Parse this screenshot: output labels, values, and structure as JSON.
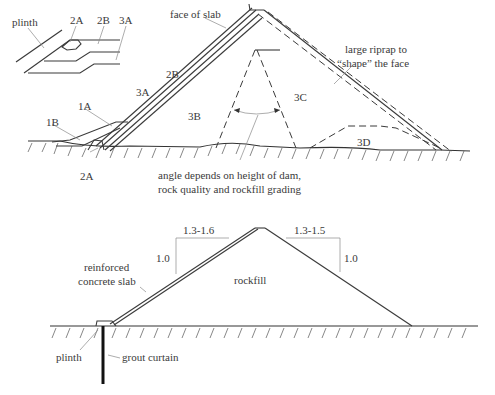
{
  "inset": {
    "labels": {
      "plinth": "plinth",
      "zone_2a": "2A",
      "zone_2b": "2B",
      "zone_3a": "3A"
    }
  },
  "upper_section": {
    "labels": {
      "face_of_slab": "face of slab",
      "riprap_line1": "large riprap to",
      "riprap_line2": "“shape” the face",
      "zone_2b": "2B",
      "zone_3a": "3A",
      "zone_1a": "1A",
      "zone_1b": "1B",
      "zone_3b": "3B",
      "zone_3c": "3C",
      "zone_3d": "3D",
      "zone_2a": "2A",
      "angle_note_line1": "angle depends on height of dam,",
      "angle_note_line2": "rock quality and rockfill grading"
    }
  },
  "lower_section": {
    "labels": {
      "upstream_slope_h": "1.3-1.6",
      "upstream_slope_v": "1.0",
      "downstream_slope_h": "1.3-1.5",
      "downstream_slope_v": "1.0",
      "slab_line1": "reinforced",
      "slab_line2": "concrete slab",
      "rockfill": "rockfill",
      "plinth": "plinth",
      "grout_curtain": "grout curtain"
    }
  }
}
